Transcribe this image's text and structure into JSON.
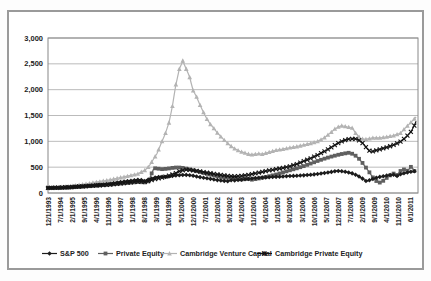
{
  "figure": {
    "background": "#ffffff",
    "frame_border_color": "#9a9a9a",
    "gridline_color": "#aaaaaa",
    "plot_border_color": "#888888",
    "label_color": "#222222"
  },
  "chart_data": {
    "type": "line",
    "title": "",
    "xlabel": "",
    "ylabel": "",
    "grid": "horizontal",
    "y_axis": {
      "min": 0,
      "max": 3000,
      "step": 500,
      "tick_labels": [
        "0",
        "500",
        "1,000",
        "1,500",
        "2,000",
        "2,500",
        "3,000"
      ]
    },
    "x_axis": {
      "tick_every_months": 7,
      "total_months": 213,
      "tick_labels": [
        "12/1/1993",
        "7/1/1994",
        "2/1/1995",
        "9/1/1995",
        "4/1/1996",
        "11/1/1996",
        "6/1/1997",
        "1/1/1998",
        "8/1/1998",
        "3/1/1999",
        "10/1/1999",
        "5/1/2000",
        "12/1/2000",
        "7/1/2001",
        "2/1/2002",
        "9/1/2002",
        "4/1/2003",
        "11/1/2003",
        "6/1/2004",
        "1/1/2005",
        "8/1/2005",
        "3/1/2006",
        "10/1/2006",
        "5/1/2007",
        "12/1/2007",
        "7/1/2008",
        "2/1/2009",
        "9/1/2009",
        "4/1/2010",
        "11/1/2010",
        "6/1/2011"
      ]
    },
    "legend": {
      "position": "bottom"
    },
    "points_note": "points are [months_since_Dec_1993, index_value_estimated_from_chart]",
    "series": [
      {
        "key": "sp500",
        "name": "S&P 500",
        "color": "#1c1c1c",
        "marker": "diamond",
        "points": [
          [
            0,
            100
          ],
          [
            6,
            100
          ],
          [
            12,
            108
          ],
          [
            18,
            124
          ],
          [
            24,
            140
          ],
          [
            30,
            158
          ],
          [
            36,
            180
          ],
          [
            42,
            212
          ],
          [
            48,
            238
          ],
          [
            53,
            260
          ],
          [
            56,
            232
          ],
          [
            59,
            272
          ],
          [
            62,
            300
          ],
          [
            65,
            315
          ],
          [
            68,
            310
          ],
          [
            71,
            322
          ],
          [
            74,
            340
          ],
          [
            77,
            346
          ],
          [
            80,
            350
          ],
          [
            83,
            340
          ],
          [
            86,
            320
          ],
          [
            89,
            300
          ],
          [
            92,
            285
          ],
          [
            95,
            268
          ],
          [
            98,
            250
          ],
          [
            101,
            238
          ],
          [
            104,
            228
          ],
          [
            106,
            248
          ],
          [
            108,
            242
          ],
          [
            111,
            255
          ],
          [
            114,
            265
          ],
          [
            117,
            278
          ],
          [
            120,
            290
          ],
          [
            124,
            298
          ],
          [
            128,
            305
          ],
          [
            132,
            313
          ],
          [
            136,
            320
          ],
          [
            140,
            328
          ],
          [
            144,
            334
          ],
          [
            148,
            342
          ],
          [
            152,
            352
          ],
          [
            156,
            368
          ],
          [
            160,
            388
          ],
          [
            164,
            408
          ],
          [
            167,
            428
          ],
          [
            170,
            420
          ],
          [
            173,
            405
          ],
          [
            176,
            380
          ],
          [
            179,
            340
          ],
          [
            181,
            300
          ],
          [
            183,
            258
          ],
          [
            184,
            232
          ],
          [
            186,
            248
          ],
          [
            188,
            272
          ],
          [
            190,
            295
          ],
          [
            192,
            312
          ],
          [
            194,
            325
          ],
          [
            196,
            338
          ],
          [
            198,
            348
          ],
          [
            200,
            352
          ],
          [
            202,
            330
          ],
          [
            204,
            362
          ],
          [
            206,
            382
          ],
          [
            208,
            398
          ],
          [
            210,
            412
          ],
          [
            212,
            420
          ],
          [
            213,
            414
          ]
        ]
      },
      {
        "key": "pe",
        "name": "Private Equity",
        "color": "#5f5f5f",
        "marker": "square",
        "points": [
          [
            0,
            95
          ],
          [
            6,
            98
          ],
          [
            12,
            105
          ],
          [
            18,
            118
          ],
          [
            24,
            132
          ],
          [
            30,
            147
          ],
          [
            36,
            163
          ],
          [
            42,
            182
          ],
          [
            48,
            200
          ],
          [
            52,
            212
          ],
          [
            56,
            205
          ],
          [
            58,
            225
          ],
          [
            60,
            380
          ],
          [
            61,
            455
          ],
          [
            62,
            478
          ],
          [
            64,
            470
          ],
          [
            66,
            462
          ],
          [
            69,
            470
          ],
          [
            72,
            486
          ],
          [
            75,
            496
          ],
          [
            78,
            486
          ],
          [
            81,
            465
          ],
          [
            84,
            440
          ],
          [
            88,
            405
          ],
          [
            92,
            370
          ],
          [
            96,
            340
          ],
          [
            100,
            310
          ],
          [
            103,
            290
          ],
          [
            105,
            302
          ],
          [
            107,
            288
          ],
          [
            109,
            275
          ],
          [
            112,
            262
          ],
          [
            115,
            276
          ],
          [
            118,
            258
          ],
          [
            121,
            274
          ],
          [
            124,
            296
          ],
          [
            128,
            325
          ],
          [
            132,
            358
          ],
          [
            136,
            398
          ],
          [
            140,
            440
          ],
          [
            144,
            478
          ],
          [
            148,
            520
          ],
          [
            152,
            570
          ],
          [
            156,
            620
          ],
          [
            160,
            665
          ],
          [
            164,
            705
          ],
          [
            168,
            740
          ],
          [
            171,
            762
          ],
          [
            174,
            778
          ],
          [
            176,
            760
          ],
          [
            178,
            722
          ],
          [
            180,
            662
          ],
          [
            182,
            582
          ],
          [
            184,
            492
          ],
          [
            186,
            400
          ],
          [
            188,
            302
          ],
          [
            190,
            232
          ],
          [
            192,
            202
          ],
          [
            194,
            236
          ],
          [
            196,
            292
          ],
          [
            198,
            342
          ],
          [
            200,
            376
          ],
          [
            202,
            348
          ],
          [
            204,
            426
          ],
          [
            206,
            456
          ],
          [
            208,
            432
          ],
          [
            210,
            506
          ],
          [
            211,
            482
          ],
          [
            212,
            426
          ],
          [
            213,
            432
          ]
        ]
      },
      {
        "key": "cvc",
        "name": "Cambridge Venture Capital",
        "color": "#b3b3b3",
        "marker": "triangle",
        "points": [
          [
            0,
            100
          ],
          [
            6,
            110
          ],
          [
            12,
            130
          ],
          [
            18,
            155
          ],
          [
            24,
            188
          ],
          [
            30,
            222
          ],
          [
            36,
            256
          ],
          [
            42,
            300
          ],
          [
            48,
            342
          ],
          [
            52,
            372
          ],
          [
            56,
            440
          ],
          [
            58,
            500
          ],
          [
            60,
            600
          ],
          [
            63,
            760
          ],
          [
            66,
            1000
          ],
          [
            68,
            1160
          ],
          [
            70,
            1360
          ],
          [
            72,
            1680
          ],
          [
            74,
            2100
          ],
          [
            76,
            2400
          ],
          [
            78,
            2560
          ],
          [
            80,
            2400
          ],
          [
            82,
            2240
          ],
          [
            84,
            1980
          ],
          [
            86,
            1860
          ],
          [
            88,
            1700
          ],
          [
            90,
            1560
          ],
          [
            92,
            1430
          ],
          [
            94,
            1330
          ],
          [
            96,
            1250
          ],
          [
            98,
            1165
          ],
          [
            100,
            1090
          ],
          [
            102,
            1025
          ],
          [
            104,
            960
          ],
          [
            106,
            905
          ],
          [
            108,
            860
          ],
          [
            110,
            825
          ],
          [
            112,
            795
          ],
          [
            114,
            775
          ],
          [
            116,
            755
          ],
          [
            118,
            742
          ],
          [
            120,
            752
          ],
          [
            122,
            762
          ],
          [
            124,
            752
          ],
          [
            126,
            772
          ],
          [
            128,
            792
          ],
          [
            130,
            812
          ],
          [
            132,
            830
          ],
          [
            136,
            850
          ],
          [
            140,
            878
          ],
          [
            144,
            900
          ],
          [
            148,
            930
          ],
          [
            152,
            962
          ],
          [
            156,
            1000
          ],
          [
            160,
            1070
          ],
          [
            164,
            1180
          ],
          [
            166,
            1240
          ],
          [
            168,
            1280
          ],
          [
            170,
            1302
          ],
          [
            173,
            1282
          ],
          [
            176,
            1262
          ],
          [
            178,
            1160
          ],
          [
            181,
            1050
          ],
          [
            184,
            1040
          ],
          [
            188,
            1068
          ],
          [
            192,
            1068
          ],
          [
            196,
            1088
          ],
          [
            200,
            1112
          ],
          [
            204,
            1160
          ],
          [
            208,
            1300
          ],
          [
            211,
            1400
          ],
          [
            213,
            1470
          ]
        ]
      },
      {
        "key": "cpe",
        "name": "Cambridge Private Equity",
        "color": "#141414",
        "marker": "x",
        "points": [
          [
            0,
            100
          ],
          [
            6,
            104
          ],
          [
            12,
            115
          ],
          [
            18,
            126
          ],
          [
            24,
            138
          ],
          [
            30,
            150
          ],
          [
            36,
            162
          ],
          [
            42,
            185
          ],
          [
            48,
            208
          ],
          [
            53,
            225
          ],
          [
            56,
            215
          ],
          [
            59,
            240
          ],
          [
            62,
            268
          ],
          [
            65,
            290
          ],
          [
            68,
            315
          ],
          [
            71,
            345
          ],
          [
            74,
            385
          ],
          [
            76,
            420
          ],
          [
            78,
            440
          ],
          [
            80,
            452
          ],
          [
            82,
            448
          ],
          [
            84,
            438
          ],
          [
            88,
            418
          ],
          [
            92,
            392
          ],
          [
            96,
            372
          ],
          [
            100,
            350
          ],
          [
            104,
            330
          ],
          [
            108,
            320
          ],
          [
            112,
            330
          ],
          [
            116,
            352
          ],
          [
            120,
            380
          ],
          [
            124,
            408
          ],
          [
            128,
            436
          ],
          [
            132,
            462
          ],
          [
            136,
            486
          ],
          [
            140,
            515
          ],
          [
            144,
            560
          ],
          [
            148,
            615
          ],
          [
            152,
            672
          ],
          [
            156,
            735
          ],
          [
            160,
            805
          ],
          [
            164,
            885
          ],
          [
            168,
            965
          ],
          [
            171,
            1015
          ],
          [
            174,
            1042
          ],
          [
            177,
            1052
          ],
          [
            179,
            1040
          ],
          [
            181,
            1000
          ],
          [
            183,
            930
          ],
          [
            185,
            845
          ],
          [
            187,
            792
          ],
          [
            189,
            815
          ],
          [
            192,
            845
          ],
          [
            195,
            875
          ],
          [
            198,
            905
          ],
          [
            201,
            942
          ],
          [
            204,
            995
          ],
          [
            207,
            1075
          ],
          [
            210,
            1185
          ],
          [
            212,
            1305
          ],
          [
            213,
            1390
          ]
        ]
      }
    ]
  }
}
